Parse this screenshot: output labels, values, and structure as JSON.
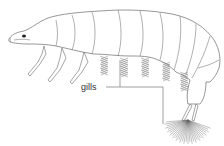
{
  "diagram": {
    "labels": [
      {
        "id": "gills",
        "text": "gills"
      }
    ],
    "colors": {
      "line": "#6a6a6a",
      "label": "#333333",
      "background": "#ffffff"
    }
  }
}
